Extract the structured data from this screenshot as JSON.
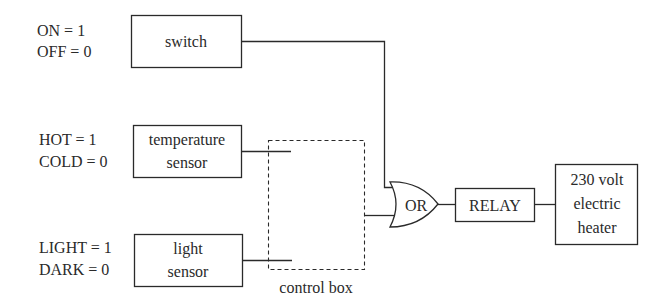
{
  "inputs": [
    {
      "line1": "ON = 1",
      "line2": "OFF = 0",
      "box_lines": [
        "switch"
      ]
    },
    {
      "line1": "HOT = 1",
      "line2": "COLD = 0",
      "box_lines": [
        "temperature",
        "sensor"
      ]
    },
    {
      "line1": "LIGHT = 1",
      "line2": "DARK = 0",
      "box_lines": [
        "light",
        "sensor"
      ]
    }
  ],
  "control_box": {
    "label": "control box"
  },
  "gate": {
    "label": "OR"
  },
  "relay": {
    "label": "RELAY"
  },
  "heater": {
    "lines": [
      "230 volt",
      "electric",
      "heater"
    ]
  },
  "colors": {
    "stroke": "#2a2a2a",
    "background": "#ffffff"
  }
}
